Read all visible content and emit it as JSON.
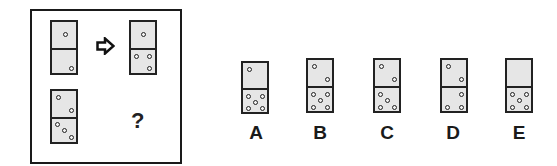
{
  "puzzle": {
    "description": "Domino analogy puzzle",
    "example": {
      "source": {
        "top": 1,
        "bottom": 1
      },
      "target": {
        "top": 1,
        "bottom": 3
      }
    },
    "question": {
      "source": {
        "top": 2,
        "bottom": 3
      },
      "target_symbol": "?"
    },
    "arrow_symbol": "right-outline-arrow"
  },
  "options": [
    {
      "label": "A",
      "top": 1,
      "bottom": 5
    },
    {
      "label": "B",
      "top": 2,
      "bottom": 5
    },
    {
      "label": "C",
      "top": 2,
      "bottom": 4
    },
    {
      "label": "D",
      "top": 2,
      "bottom": 3
    },
    {
      "label": "E",
      "top": 0,
      "bottom": 5
    }
  ],
  "colors": {
    "domino_fill": "#e6e6e6",
    "border": "#222222",
    "background": "#ffffff"
  }
}
